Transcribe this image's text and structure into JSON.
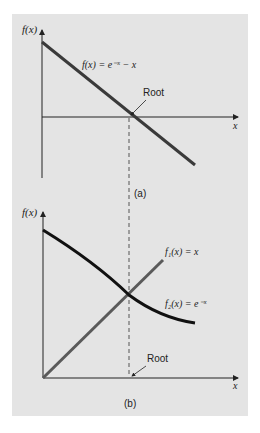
{
  "figure": {
    "background": "#e4e4e4",
    "dashed_line_color": "#555555",
    "panel_a": {
      "caption": "(a)",
      "y_axis_label": "f(x)",
      "x_axis_label": "x",
      "curve_label": "f(x) = e⁻ˣ − x",
      "root_label": "Root",
      "curve_color": "#3a3a3a"
    },
    "panel_b": {
      "caption": "(b)",
      "y_axis_label": "f(x)",
      "x_axis_label": "x",
      "f1_label": "f₁(x) = x",
      "f2_label": "f₂(x) = e⁻ˣ",
      "root_label": "Root",
      "f1_color": "#5a5a5a",
      "f2_color": "#111111"
    }
  }
}
